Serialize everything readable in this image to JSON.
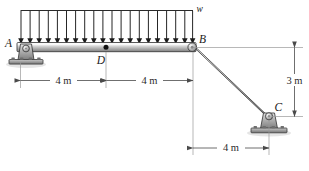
{
  "figure": {
    "type": "statics-free-body-diagram"
  },
  "labels": {
    "point_a": "A",
    "point_b": "B",
    "point_c": "C",
    "point_d": "D",
    "load_w": "w"
  },
  "dimensions": {
    "span_ad": "4 m",
    "span_db": "4 m",
    "drop_bc_vertical": "3 m",
    "offset_bc_horizontal": "4 m"
  },
  "distributed_load": {
    "arrow_count": 20,
    "direction": "downward",
    "extent": "A to B"
  },
  "colors": {
    "member_light": "#e8e8e8",
    "member_mid": "#b8b8b8",
    "member_dark": "#888888",
    "outline": "#3a3a3a",
    "dim_line": "#4a4a4a",
    "arrow": "#1a1a1a",
    "support_fill": "#9a9a9a"
  },
  "geometry": {
    "a_x": 20,
    "a_y": 47,
    "b_x": 193,
    "b_y": 47,
    "d_x": 106,
    "d_y": 47,
    "c_x": 267,
    "c_y": 116,
    "load_top_y": 10
  }
}
